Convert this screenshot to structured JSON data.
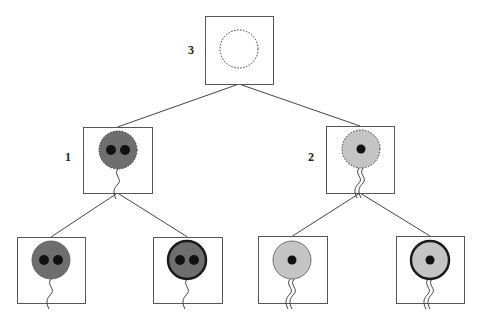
{
  "diagram": {
    "type": "tree",
    "colors": {
      "box_stroke": "#555555",
      "edge": "#444444",
      "dark_cell": "#6e6e6e",
      "light_cell": "#c4c4c4",
      "nucleus": "#111111",
      "thick_outline": "#1a1a1a"
    },
    "nodes": [
      {
        "id": "n3",
        "label": "3",
        "box": [
          205,
          16,
          68,
          68
        ],
        "cell": {
          "cx": 239,
          "cy": 49,
          "r": 19,
          "fill": "none",
          "outline": "dotted",
          "nuclei": 0,
          "tails": 0
        }
      },
      {
        "id": "n1",
        "label": "1",
        "box": [
          83,
          127,
          69,
          66
        ],
        "cell": {
          "cx": 118,
          "cy": 150,
          "r": 19,
          "fill": "dark",
          "outline": "dotted",
          "nuclei": 2,
          "tails": 1
        }
      },
      {
        "id": "n2",
        "label": "2",
        "box": [
          326,
          126,
          68,
          67
        ],
        "cell": {
          "cx": 361,
          "cy": 149,
          "r": 19,
          "fill": "light",
          "outline": "dotted",
          "nuclei": 1,
          "tails": 2
        }
      },
      {
        "id": "n4",
        "label": "",
        "box": [
          17,
          237,
          68,
          66
        ],
        "cell": {
          "cx": 51,
          "cy": 260,
          "r": 19,
          "fill": "dark",
          "outline": "thin",
          "nuclei": 2,
          "tails": 1
        }
      },
      {
        "id": "n5",
        "label": "",
        "box": [
          153,
          237,
          69,
          66
        ],
        "cell": {
          "cx": 187,
          "cy": 260,
          "r": 19,
          "fill": "dark",
          "outline": "thick",
          "nuclei": 2,
          "tails": 1
        }
      },
      {
        "id": "n6",
        "label": "",
        "box": [
          258,
          236,
          69,
          67
        ],
        "cell": {
          "cx": 292,
          "cy": 260,
          "r": 19,
          "fill": "light",
          "outline": "thin",
          "nuclei": 1,
          "tails": 2
        }
      },
      {
        "id": "n7",
        "label": "",
        "box": [
          396,
          236,
          68,
          67
        ],
        "cell": {
          "cx": 430,
          "cy": 260,
          "r": 19,
          "fill": "light",
          "outline": "thick",
          "nuclei": 1,
          "tails": 2
        }
      }
    ],
    "edges": [
      {
        "from": "n3",
        "to": "n1"
      },
      {
        "from": "n3",
        "to": "n2"
      },
      {
        "from": "n1",
        "to": "n4"
      },
      {
        "from": "n1",
        "to": "n5"
      },
      {
        "from": "n2",
        "to": "n6"
      },
      {
        "from": "n2",
        "to": "n7"
      }
    ],
    "labels": [
      {
        "text": "3",
        "x": 188,
        "y": 54
      },
      {
        "text": "1",
        "x": 65,
        "y": 161
      },
      {
        "text": "2",
        "x": 308,
        "y": 161
      }
    ]
  }
}
